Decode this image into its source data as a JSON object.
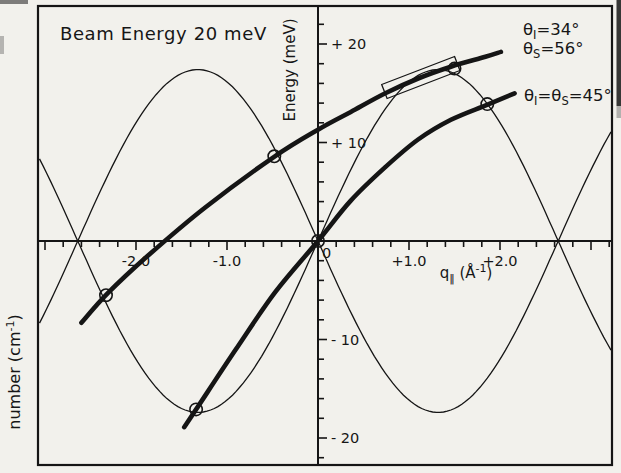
{
  "figure": {
    "title": "Beam Energy 20 meV",
    "axis_y_label": "Energy (meV)",
    "origin_label": "0",
    "axis_x_label_parts": [
      {
        "t": "q"
      },
      {
        "t": "‖",
        "sub": true
      },
      {
        "t": " ("
      },
      {
        "t": "Å"
      },
      {
        "t": "-1",
        "sup": true
      },
      {
        "t": ")"
      }
    ],
    "outer_left_label_parts": [
      {
        "t": "number (cm"
      },
      {
        "t": "-1",
        "sup": true
      },
      {
        "t": ")"
      }
    ],
    "curve_labels": [
      {
        "id": "theta-34",
        "parts": [
          {
            "t": "θ"
          },
          {
            "t": "I",
            "sub": true
          },
          {
            "t": "=34°"
          }
        ]
      },
      {
        "id": "theta-56",
        "parts": [
          {
            "t": "θ"
          },
          {
            "t": "S",
            "sub": true
          },
          {
            "t": "=56°"
          }
        ]
      },
      {
        "id": "theta-45",
        "parts": [
          {
            "t": "θ"
          },
          {
            "t": "I",
            "sub": true
          },
          {
            "t": "="
          },
          {
            "t": "θ"
          },
          {
            "t": "S",
            "sub": true
          },
          {
            "t": "=45°"
          }
        ]
      }
    ],
    "ink_color": "#151515",
    "paper_color": "#f2f1ec"
  },
  "chart_data": {
    "type": "line",
    "title": "Beam Energy 20 meV",
    "xlabel": "q‖ (Å⁻¹)",
    "ylabel": "Energy (meV)",
    "xlim": [
      -3.08,
      3.23
    ],
    "ylim": [
      -23.9,
      23.9
    ],
    "grid": false,
    "x_major_ticks": [
      {
        "q": -2,
        "label": "-2.0"
      },
      {
        "q": -1,
        "label": "-1.0"
      },
      {
        "q": 1,
        "label": "+1.0"
      },
      {
        "q": 2,
        "label": "+2.0"
      }
    ],
    "x_minor_step": 0.2,
    "y_major_ticks": [
      {
        "E": 20,
        "label": "+ 20"
      },
      {
        "E": 10,
        "label": "+ 10"
      },
      {
        "E": -10,
        "label": "- 10"
      },
      {
        "E": -20,
        "label": "- 20"
      }
    ],
    "y_minor_step": 2,
    "dispersion": {
      "shape": "sine",
      "amplitude_meV": 17.4,
      "zero_crossings_A-1": [
        -2.64,
        0,
        2.64
      ],
      "extrema": [
        {
          "q": -1.32,
          "E": 17.4
        },
        {
          "q": -1.32,
          "E": -17.4
        },
        {
          "q": 1.32,
          "E": 17.4
        },
        {
          "q": 1.32,
          "E": -17.4
        }
      ],
      "q_range": [
        -3.06,
        3.22
      ],
      "branch_signs": [
        1,
        -1
      ]
    },
    "series": [
      {
        "name": "scan-curve-34-56",
        "label": "θI=34°, θS=56°",
        "points": [
          [
            -2.6,
            -8.3
          ],
          [
            -2.31,
            -5.3
          ],
          [
            -1.87,
            -1.5
          ],
          [
            -1.24,
            3.4
          ],
          [
            -0.49,
            8.5
          ],
          [
            0.0,
            11.3
          ],
          [
            0.36,
            13.1
          ],
          [
            0.74,
            15.0
          ],
          [
            1.1,
            16.5
          ],
          [
            1.46,
            17.7
          ],
          [
            1.84,
            18.7
          ],
          [
            2.01,
            19.2
          ]
        ]
      },
      {
        "name": "scan-curve-45",
        "label": "θI=θS=45°",
        "points": [
          [
            -1.47,
            -18.9
          ],
          [
            -1.34,
            -17.1
          ],
          [
            -0.91,
            -11.1
          ],
          [
            -0.47,
            -5.2
          ],
          [
            0.0,
            0.0
          ],
          [
            0.36,
            4.1
          ],
          [
            0.74,
            7.5
          ],
          [
            1.1,
            10.3
          ],
          [
            1.46,
            12.3
          ],
          [
            1.85,
            13.8
          ],
          [
            2.16,
            15.0
          ]
        ]
      }
    ],
    "intersection_markers": [
      [
        -2.33,
        -5.5
      ],
      [
        -1.34,
        -17.1
      ],
      [
        -0.48,
        8.6
      ],
      [
        0.0,
        0.0
      ],
      [
        1.5,
        17.5
      ],
      [
        1.86,
        13.9
      ]
    ],
    "resolution_box": {
      "center_q": 1.13,
      "center_E": 16.6,
      "length_px": 78,
      "height_px": 15,
      "angle_deg": -21
    }
  }
}
